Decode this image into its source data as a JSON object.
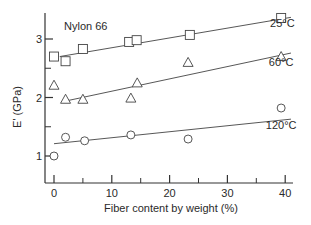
{
  "chart_data": {
    "type": "scatter",
    "title": "Nylon 66",
    "xlabel": "Fiber content by weight  (%)",
    "ylabel": "E' (GPa)",
    "xlim": [
      -1.5,
      43
    ],
    "ylim": [
      0.55,
      3.45
    ],
    "x_ticks": [
      0,
      10,
      20,
      30,
      40
    ],
    "x_tick_labels": [
      "0",
      "10",
      "20",
      "30",
      "40"
    ],
    "x_minor_ticks": [
      5,
      15,
      25,
      35
    ],
    "y_ticks": [
      1,
      2,
      3
    ],
    "y_tick_labels": [
      "1",
      "2",
      "3"
    ],
    "y_minor_ticks": [
      1.5,
      2.5
    ],
    "grid": false,
    "legend": "inline labels at right end of each fit line",
    "series": [
      {
        "name": "25°C",
        "marker": "square",
        "points": [
          [
            0,
            2.7
          ],
          [
            2,
            2.62
          ],
          [
            5,
            2.83
          ],
          [
            13,
            2.95
          ],
          [
            14.3,
            2.98
          ],
          [
            23.5,
            3.07
          ],
          [
            39.3,
            3.36
          ]
        ],
        "fit_line": [
          [
            1,
            2.7
          ],
          [
            41,
            3.37
          ]
        ],
        "label_pos": [
          39.5,
          3.2
        ]
      },
      {
        "name": "60°C",
        "marker": "triangle",
        "points": [
          [
            0,
            2.21
          ],
          [
            2,
            1.97
          ],
          [
            5,
            1.97
          ],
          [
            13.3,
            1.99
          ],
          [
            14.4,
            2.25
          ],
          [
            23.2,
            2.6
          ],
          [
            39.3,
            2.7
          ]
        ],
        "fit_line": [
          [
            2.5,
            1.95
          ],
          [
            41,
            2.76
          ]
        ],
        "label_pos": [
          39.3,
          2.53
        ]
      },
      {
        "name": "120°C",
        "marker": "circle",
        "points": [
          [
            0,
            1.0
          ],
          [
            2,
            1.32
          ],
          [
            5.3,
            1.26
          ],
          [
            13.3,
            1.36
          ],
          [
            23.2,
            1.29
          ],
          [
            39.3,
            1.82
          ]
        ],
        "fit_line": [
          [
            0,
            1.21
          ],
          [
            41,
            1.63
          ]
        ],
        "label_pos": [
          39.3,
          1.46
        ]
      }
    ]
  },
  "labels": {
    "title": "Nylon 66",
    "xlabel": "Fiber content by weight  (%)",
    "ylabel": "E' (GPa)"
  }
}
